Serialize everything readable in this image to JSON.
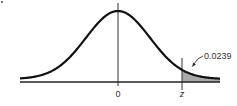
{
  "chart_data": {
    "type": "area",
    "title": "",
    "xlabel": "",
    "ylabel": "",
    "tick_labels": [
      "0",
      "z"
    ],
    "annotations": [
      {
        "text": "0.0239",
        "target": "shaded right-tail area beyond z"
      }
    ],
    "shaded_region": {
      "from": "z",
      "to": "+inf",
      "area": 0.0239
    },
    "grid": false,
    "legend": null,
    "colors": {
      "curve": "#111111",
      "shade": "#aaaaaa",
      "axis": "#222222"
    }
  },
  "labels": {
    "zero": "0",
    "z": "z",
    "area": "0.0239"
  }
}
